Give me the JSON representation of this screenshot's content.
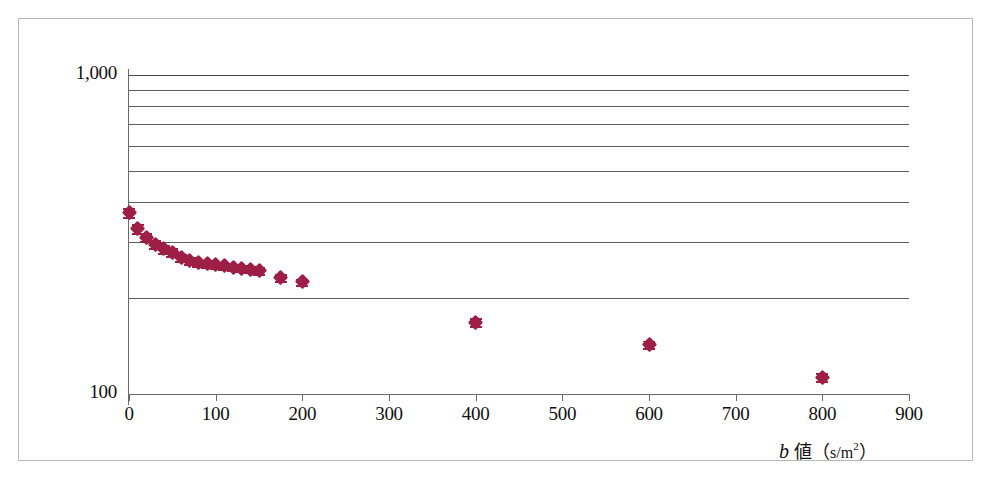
{
  "figure": {
    "frame_color": "#b9b9b9",
    "background": "#ffffff"
  },
  "axis_title_parts": {
    "symbol": "b",
    "word": "値",
    "open_paren": "（",
    "unit_main": "s/m",
    "unit_exp": "2",
    "close_paren": "）"
  },
  "chart_data": {
    "type": "scatter",
    "title": "",
    "xlabel": "b 値（s/m²）",
    "ylabel": "",
    "xlim": [
      0,
      900
    ],
    "ylim": [
      100,
      1000
    ],
    "yscale": "log",
    "xscale": "linear",
    "grid": "horizontal-only",
    "legend": "none",
    "marker_color": "#9d1f47",
    "marker_shape": "diamond",
    "xticks": [
      0,
      100,
      200,
      300,
      400,
      500,
      600,
      700,
      800,
      900
    ],
    "xticklabels": [
      "0",
      "100",
      "200",
      "300",
      "400",
      "500",
      "600",
      "700",
      "800",
      "900"
    ],
    "yticks": [
      100,
      1000
    ],
    "yticklabels": [
      "100",
      "1,000"
    ],
    "ygridlines": [
      1000,
      900,
      800,
      700,
      600,
      500,
      400,
      300,
      200,
      100
    ],
    "series": [
      {
        "name": "signal",
        "x": [
          0,
          10,
          20,
          30,
          40,
          50,
          60,
          70,
          80,
          90,
          100,
          110,
          120,
          130,
          140,
          150,
          175,
          200,
          400,
          600,
          800
        ],
        "y": [
          370,
          330,
          310,
          295,
          285,
          278,
          268,
          262,
          258,
          256,
          254,
          252,
          250,
          248,
          246,
          244,
          232,
          225,
          168,
          143,
          113
        ],
        "yerr": [
          12,
          11,
          9,
          8,
          8,
          8,
          7,
          7,
          6,
          6,
          6,
          6,
          6,
          6,
          6,
          6,
          6,
          5,
          5,
          4,
          3
        ]
      }
    ]
  }
}
